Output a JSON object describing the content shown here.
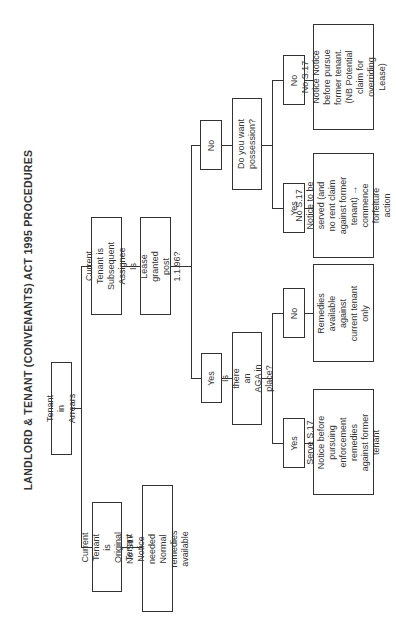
{
  "title": "LANDLORD & TENANT (CONVENANTS) ACT 1995 PROCEDURES",
  "nodes": {
    "root": "Tenant in Arrears",
    "original_tenant": "Current Tenant is Original Tenant",
    "original_result": "No S17 Notice needed Normal remedies available",
    "subsequent_assignee": "Current Tenant is Subsequent Assignee",
    "lease_question": "Is Lease granted post 1.1.96?",
    "lease_no": "No",
    "lease_yes": "Yes",
    "possession_question": "Do you want possession?",
    "possession_no": "No",
    "possession_no_result": "No S.17 Notice Notice before pursue former tenant. (NB Potential claim for overriding Lease)",
    "possession_yes": "Yes",
    "possession_yes_result": "No S.17 Notice to be served (and no rent claim against former tenant) → commence forfeiture action",
    "aga_question": "Is there an AGA in place?",
    "aga_no": "No",
    "aga_no_result": "Remedies available against current tenant only",
    "aga_yes": "Yes",
    "aga_yes_result": "Serve S.17 Notice before pursuing enforcement remedies against former tenant"
  }
}
